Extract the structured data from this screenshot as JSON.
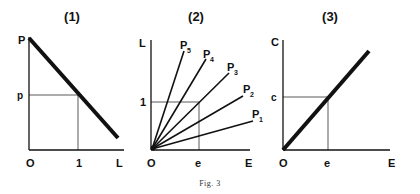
{
  "figure": {
    "caption": "Fig. 3",
    "ink_color": "#111111",
    "panels": [
      {
        "id": "1",
        "title": "(1)",
        "y_axis_label": "P",
        "x_axis_label": "L",
        "origin_label": "O",
        "y_tick_label": "p",
        "x_tick_label": "1",
        "description": "Downward-sloping thick line from P on the vertical axis; guide lines from p and 1 meet on the line"
      },
      {
        "id": "2",
        "title": "(2)",
        "y_axis_label": "L",
        "x_axis_label": "E",
        "origin_label": "O",
        "y_tick_label": "1",
        "x_tick_label": "e",
        "rays": [
          {
            "label": "P",
            "sub": "1"
          },
          {
            "label": "P",
            "sub": "2"
          },
          {
            "label": "P",
            "sub": "3"
          },
          {
            "label": "P",
            "sub": "4"
          },
          {
            "label": "P",
            "sub": "5"
          }
        ],
        "description": "Five rays from origin labelled P1 to P5 with increasing slope; guide rectangle at L=1, E=e"
      },
      {
        "id": "3",
        "title": "(3)",
        "y_axis_label": "C",
        "x_axis_label": "E",
        "origin_label": "O",
        "y_tick_label": "c",
        "x_tick_label": "e",
        "description": "Upward-sloping thick line through origin; guide lines from c and e meet on the line"
      }
    ]
  }
}
